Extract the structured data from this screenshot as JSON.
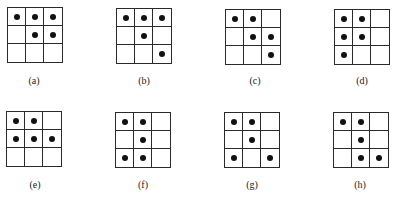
{
  "figure": {
    "panels": [
      {
        "id": "a",
        "label": "(a)",
        "grid": {
          "left": 7,
          "top": 7,
          "size": 56
        },
        "label_pos": {
          "x": 34,
          "y": 75
        },
        "dots": [
          [
            0,
            0
          ],
          [
            0,
            1
          ],
          [
            0,
            2
          ],
          [
            1,
            1
          ],
          [
            1,
            2
          ]
        ]
      },
      {
        "id": "b",
        "label": "(b)",
        "grid": {
          "left": 116,
          "top": 8,
          "size": 56
        },
        "label_pos": {
          "x": 144,
          "y": 75
        },
        "dots": [
          [
            0,
            0
          ],
          [
            0,
            1
          ],
          [
            0,
            2
          ],
          [
            1,
            1
          ],
          [
            2,
            2
          ]
        ]
      },
      {
        "id": "c",
        "label": "(c)",
        "grid": {
          "left": 225,
          "top": 9,
          "size": 56
        },
        "label_pos": {
          "x": 255,
          "y": 75
        },
        "dots": [
          [
            0,
            0
          ],
          [
            0,
            1
          ],
          [
            1,
            1
          ],
          [
            1,
            2
          ],
          [
            2,
            2
          ]
        ]
      },
      {
        "id": "d",
        "label": "(d)",
        "grid": {
          "left": 334,
          "top": 9,
          "size": 56
        },
        "label_pos": {
          "x": 362,
          "y": 75
        },
        "dots": [
          [
            0,
            0
          ],
          [
            0,
            1
          ],
          [
            1,
            0
          ],
          [
            1,
            1
          ],
          [
            2,
            0
          ]
        ]
      },
      {
        "id": "e",
        "label": "(e)",
        "grid": {
          "left": 6,
          "top": 111,
          "size": 56
        },
        "label_pos": {
          "x": 35,
          "y": 179
        },
        "dots": [
          [
            0,
            0
          ],
          [
            0,
            1
          ],
          [
            1,
            0
          ],
          [
            1,
            1
          ],
          [
            1,
            2
          ]
        ]
      },
      {
        "id": "f",
        "label": "(f)",
        "grid": {
          "left": 115,
          "top": 112,
          "size": 56
        },
        "label_pos": {
          "x": 143,
          "y": 179
        },
        "dots": [
          [
            0,
            0
          ],
          [
            0,
            1
          ],
          [
            1,
            1
          ],
          [
            2,
            0
          ],
          [
            2,
            1
          ]
        ]
      },
      {
        "id": "g",
        "label": "(g)",
        "grid": {
          "left": 224,
          "top": 112,
          "size": 56
        },
        "label_pos": {
          "x": 252,
          "y": 179
        },
        "dots": [
          [
            0,
            0
          ],
          [
            0,
            1
          ],
          [
            1,
            1
          ],
          [
            2,
            0
          ],
          [
            2,
            2
          ]
        ]
      },
      {
        "id": "h",
        "label": "(h)",
        "grid": {
          "left": 333,
          "top": 112,
          "size": 56
        },
        "label_pos": {
          "x": 360,
          "y": 179
        },
        "dots": [
          [
            0,
            0
          ],
          [
            0,
            1
          ],
          [
            1,
            1
          ],
          [
            2,
            1
          ],
          [
            2,
            2
          ]
        ]
      }
    ],
    "colors": {
      "line": "#2a2a2a",
      "dot": "#111111",
      "background": "#ffffff"
    }
  }
}
